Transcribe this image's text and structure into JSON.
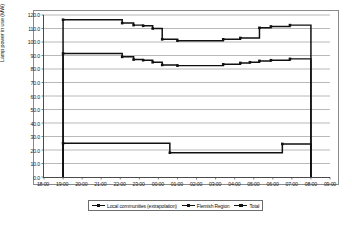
{
  "chart_data": {
    "type": "line",
    "title": "",
    "xlabel": "",
    "ylabel": "Lamp power in use (MW)",
    "ylim": [
      0,
      120
    ],
    "ytick_labels": [
      "0.0",
      "10.0",
      "20.0",
      "30.0",
      "40.0",
      "50.0",
      "60.0",
      "70.0",
      "80.0",
      "90.0",
      "100.0",
      "110.0",
      "120.0"
    ],
    "ytick_values": [
      0,
      10,
      20,
      30,
      40,
      50,
      60,
      70,
      80,
      90,
      100,
      110,
      120
    ],
    "xtick_labels": [
      "18:00",
      "19:00",
      "20:00",
      "21:00",
      "22:00",
      "23:00",
      "00:00",
      "01:00",
      "02:00",
      "03:00",
      "04:00",
      "05:00",
      "06:00",
      "07:00",
      "08:00",
      "09:00"
    ],
    "xtick_values": [
      0,
      1,
      2,
      3,
      4,
      5,
      6,
      7,
      8,
      9,
      10,
      11,
      12,
      13,
      14,
      15
    ],
    "xlim": [
      0,
      15
    ],
    "grid": true,
    "grid_axis": "y",
    "legend_position": "bottom-center",
    "line_style": "step",
    "series": [
      {
        "name": "Local communities (extrapolation)",
        "color": "#111111",
        "points": [
          [
            1.0,
            0.0
          ],
          [
            1.0,
            91.5
          ],
          [
            4.1,
            91.5
          ],
          [
            4.1,
            89.0
          ],
          [
            4.7,
            89.0
          ],
          [
            4.7,
            87.0
          ],
          [
            5.2,
            87.0
          ],
          [
            5.2,
            86.5
          ],
          [
            5.7,
            86.5
          ],
          [
            5.7,
            85.0
          ],
          [
            6.2,
            85.0
          ],
          [
            6.2,
            83.0
          ],
          [
            7.0,
            83.0
          ],
          [
            7.0,
            82.5
          ],
          [
            9.4,
            82.5
          ],
          [
            9.4,
            83.5
          ],
          [
            10.3,
            83.5
          ],
          [
            10.3,
            84.5
          ],
          [
            10.8,
            84.5
          ],
          [
            10.8,
            85.0
          ],
          [
            11.3,
            85.0
          ],
          [
            11.3,
            86.0
          ],
          [
            11.9,
            86.0
          ],
          [
            11.9,
            86.5
          ],
          [
            12.9,
            86.5
          ],
          [
            12.9,
            87.5
          ],
          [
            14.0,
            87.5
          ],
          [
            14.0,
            0.0
          ]
        ]
      },
      {
        "name": "Flemish Region",
        "color": "#111111",
        "points": [
          [
            1.0,
            0.0
          ],
          [
            1.0,
            25.0
          ],
          [
            6.6,
            25.0
          ],
          [
            6.6,
            18.0
          ],
          [
            12.5,
            18.0
          ],
          [
            12.5,
            24.5
          ],
          [
            14.0,
            24.5
          ],
          [
            14.0,
            0.0
          ]
        ]
      },
      {
        "name": "Total",
        "color": "#111111",
        "points": [
          [
            1.0,
            0.0
          ],
          [
            1.0,
            116.5
          ],
          [
            4.1,
            116.5
          ],
          [
            4.1,
            114.0
          ],
          [
            4.7,
            114.0
          ],
          [
            4.7,
            112.5
          ],
          [
            5.2,
            112.5
          ],
          [
            5.2,
            112.0
          ],
          [
            5.7,
            112.0
          ],
          [
            5.7,
            110.0
          ],
          [
            6.2,
            110.0
          ],
          [
            6.2,
            102.0
          ],
          [
            7.0,
            102.0
          ],
          [
            7.0,
            101.0
          ],
          [
            9.4,
            101.0
          ],
          [
            9.4,
            102.0
          ],
          [
            10.3,
            102.0
          ],
          [
            10.3,
            103.0
          ],
          [
            11.3,
            103.0
          ],
          [
            11.3,
            110.5
          ],
          [
            11.9,
            110.5
          ],
          [
            11.9,
            111.5
          ],
          [
            12.9,
            111.5
          ],
          [
            12.9,
            112.5
          ],
          [
            14.0,
            112.5
          ],
          [
            14.0,
            0.0
          ]
        ]
      }
    ]
  },
  "legend": {
    "items": [
      {
        "label": "Local communities (extrapolation)"
      },
      {
        "label": "Flemish Region"
      },
      {
        "label": "Total"
      }
    ]
  }
}
